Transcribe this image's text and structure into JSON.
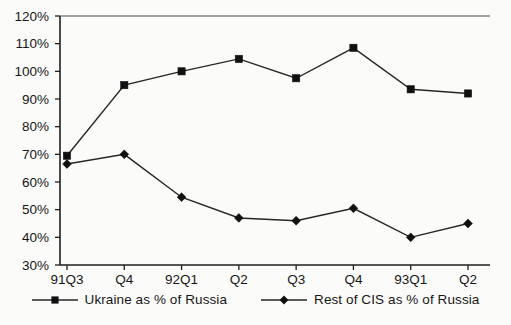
{
  "chart_data": {
    "type": "line",
    "title": "",
    "subtitle": "",
    "xlabel": "",
    "ylabel": "",
    "categories": [
      "91Q3",
      "Q4",
      "92Q1",
      "Q2",
      "Q3",
      "Q4",
      "93Q1",
      "Q2"
    ],
    "ylim": [
      30,
      120
    ],
    "ytick_labels": [
      "30%",
      "40%",
      "50%",
      "60%",
      "70%",
      "80%",
      "90%",
      "100%",
      "110%",
      "120%"
    ],
    "ytick_values": [
      30,
      40,
      50,
      60,
      70,
      80,
      90,
      100,
      110,
      120
    ],
    "ytick_step": 10,
    "grid": false,
    "legend_position": "bottom-center",
    "value_suffix": "%",
    "series": [
      {
        "name": "Ukraine as % of Russia",
        "marker": "square",
        "color": "#101010",
        "values": [
          69.5,
          95,
          100,
          104.5,
          97.5,
          108.5,
          93.5,
          92
        ]
      },
      {
        "name": "Rest of CIS as % of Russia",
        "marker": "diamond",
        "color": "#101010",
        "values": [
          66.5,
          70,
          54.5,
          47,
          46,
          50.5,
          40,
          45
        ]
      }
    ]
  },
  "legend": {
    "items": [
      {
        "label": "Ukraine as % of Russia",
        "marker": "square"
      },
      {
        "label": "Rest of CIS as % of Russia",
        "marker": "diamond"
      }
    ]
  },
  "colors": {
    "background": "#fbfbf9",
    "axis": "#1f1f1f",
    "series": "#262626",
    "marker": "#101010"
  }
}
